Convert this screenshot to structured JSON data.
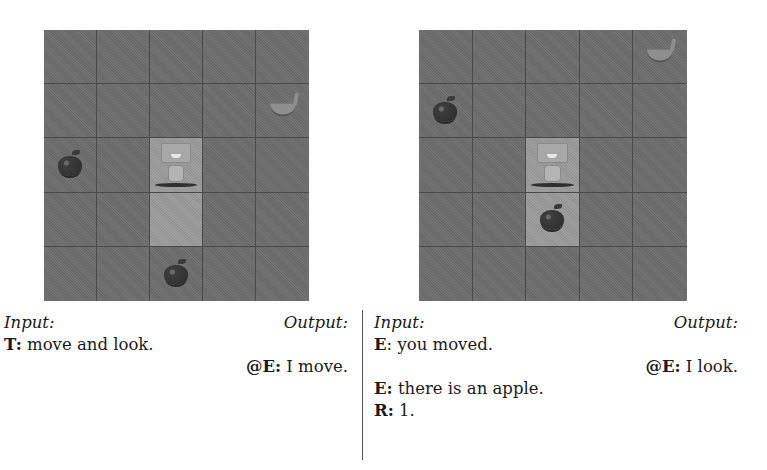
{
  "figure": {
    "panels": [
      {
        "id": "left",
        "grid": {
          "rows": 5,
          "cols": 5,
          "highlighted_cells": [
            [
              2,
              2
            ],
            [
              3,
              2
            ]
          ],
          "objects": [
            {
              "type": "banana",
              "row": 1,
              "col": 4
            },
            {
              "type": "apple",
              "row": 2,
              "col": 0
            },
            {
              "type": "robot",
              "row": 2,
              "col": 2
            },
            {
              "type": "apple",
              "row": 4,
              "col": 2
            }
          ]
        },
        "header": {
          "input_label": "Input:",
          "output_label": "Output:"
        },
        "lines": [
          {
            "side": "input",
            "speaker": "T:",
            "text": " move and look."
          },
          {
            "side": "output",
            "speaker": "@E:",
            "text": " I move."
          }
        ]
      },
      {
        "id": "right",
        "grid": {
          "rows": 5,
          "cols": 5,
          "highlighted_cells": [
            [
              2,
              2
            ],
            [
              3,
              2
            ]
          ],
          "objects": [
            {
              "type": "banana",
              "row": 0,
              "col": 4
            },
            {
              "type": "apple",
              "row": 1,
              "col": 0
            },
            {
              "type": "robot",
              "row": 2,
              "col": 2
            },
            {
              "type": "apple",
              "row": 3,
              "col": 2
            }
          ]
        },
        "header": {
          "input_label": "Input:",
          "output_label": "Output:"
        },
        "lines": [
          {
            "side": "input",
            "speaker": "E",
            "text": ": you moved."
          },
          {
            "side": "output",
            "speaker": "@E:",
            "text": " I look."
          },
          {
            "side": "input",
            "speaker": "E:",
            "text": " there is an apple."
          },
          {
            "side": "input",
            "speaker": "R:",
            "text": " 1."
          }
        ]
      }
    ]
  }
}
